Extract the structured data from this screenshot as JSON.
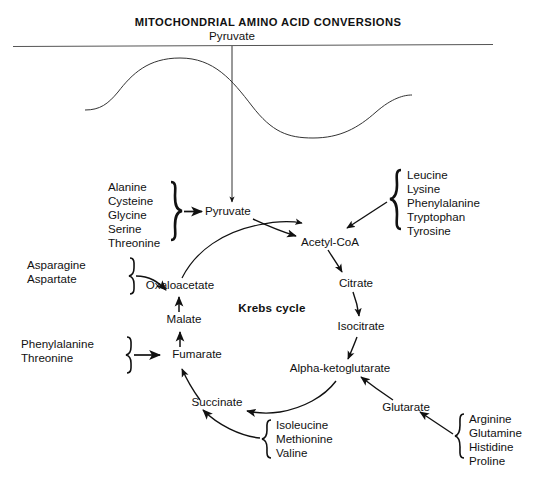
{
  "figure": {
    "title": "MITOCHONDRIAL AMINO ACID CONVERSIONS",
    "membrane_label": "Pyruvate",
    "cycle_name": "Krebs cycle",
    "caption": ""
  },
  "cycle_nodes": {
    "pyruvate": "Pyruvate",
    "acetyl_coa": "Acetyl-CoA",
    "citrate": "Citrate",
    "isocitrate": "Isocitrate",
    "alpha_ketoglutarate": "Alpha-ketoglutarate",
    "glutarate": "Glutarate",
    "succinate": "Succinate",
    "fumarate": "Fumarate",
    "malate": "Malate",
    "oxaloacetate": "Oxaloacetate"
  },
  "amino_acid_groups": {
    "to_pyruvate": {
      "items": [
        "Alanine",
        "Cysteine",
        "Glycine",
        "Serine",
        "Threonine"
      ]
    },
    "to_acetyl_coa": {
      "items": [
        "Leucine",
        "Lysine",
        "Phenylalanine",
        "Tryptophan",
        "Tyrosine"
      ]
    },
    "to_oxaloacetate": {
      "items": [
        "Asparagine",
        "Aspartate"
      ]
    },
    "to_fumarate": {
      "items": [
        "Phenylalanine",
        "Threonine"
      ]
    },
    "to_succinate": {
      "items": [
        "Isoleucine",
        "Methionine",
        "Valine"
      ]
    },
    "to_glutarate": {
      "items": [
        "Arginine",
        "Glutamine",
        "Histidine",
        "Proline"
      ]
    }
  },
  "colors": {
    "ink": "#111111",
    "background": "#ffffff",
    "membrane_line": "#555555"
  }
}
